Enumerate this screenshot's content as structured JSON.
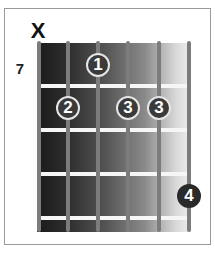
{
  "diagram": {
    "type": "guitar-chord-diagram",
    "muted_marker": "X",
    "start_fret_label": "7",
    "strings": 6,
    "frets_shown": 4,
    "fingers": [
      {
        "finger": "1",
        "string": 3,
        "fret": 1
      },
      {
        "finger": "2",
        "string": 2,
        "fret": 2
      },
      {
        "finger": "3",
        "string": 4,
        "fret": 2
      },
      {
        "finger": "3",
        "string": 5,
        "fret": 2
      },
      {
        "finger": "4",
        "string": 6,
        "fret": 4
      }
    ],
    "muted_strings": [
      1
    ],
    "colors": {
      "board_dark": "#1a1a1a",
      "board_light": "#eeeeee",
      "fret_wire": "#f6f6f6",
      "string": "#7c7c7c",
      "finger_dot": "#3a3a3a",
      "frame_border": "#9a9a9a"
    }
  }
}
